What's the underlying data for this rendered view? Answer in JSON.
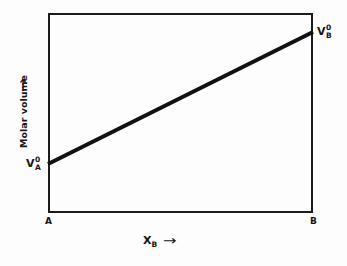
{
  "figure": {
    "background_color": "#fdfdfd",
    "line_color": "#111111",
    "frame_color": "#1b1b1b"
  },
  "axes": {
    "x": {
      "title_base": "X",
      "title_sub": "B",
      "arrow": "→",
      "left_corner_label": "A",
      "right_corner_label": "B"
    },
    "y": {
      "title": "Molar volume",
      "arrow": "↑"
    }
  },
  "annotations": {
    "left_endpoint": {
      "base": "V",
      "sup": "0",
      "sub": "A"
    },
    "right_endpoint": {
      "base": "V",
      "sup": "0",
      "sub": "B"
    }
  },
  "chart_data": {
    "type": "line",
    "title": "",
    "subtitle": "",
    "xlabel": "X_B",
    "ylabel": "Molar volume",
    "xlim": [
      0,
      1
    ],
    "ylim": [
      0,
      1
    ],
    "grid": false,
    "legend": "none",
    "axis_tick_labels": {
      "x": [
        "A",
        "B"
      ],
      "y": []
    },
    "series": [
      {
        "name": "Ideal solution molar volume",
        "x": [
          0,
          1
        ],
        "y": [
          0.245,
          0.905
        ],
        "style": "solid",
        "linewidth": 3,
        "color": "#111111",
        "point_labels": [
          "V^0_A",
          "V^0_B"
        ]
      }
    ],
    "annotations": [
      {
        "text": "V^0_A",
        "x": 0,
        "y": 0.245,
        "position": "left"
      },
      {
        "text": "V^0_B",
        "x": 1,
        "y": 0.905,
        "position": "right"
      }
    ]
  }
}
